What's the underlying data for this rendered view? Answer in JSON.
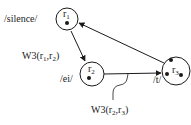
{
  "diagram": {
    "nodes": [
      {
        "id": "r1",
        "name": "r",
        "subscript": "1",
        "phoneme": "/silence/",
        "dots": 1
      },
      {
        "id": "r2",
        "name": "r",
        "subscript": "2",
        "phoneme": "/ei/",
        "dots": 1
      },
      {
        "id": "r3",
        "name": "r",
        "subscript": "3",
        "phoneme": "/t/",
        "dots": 3
      }
    ],
    "edges": [
      {
        "from": "r1",
        "to": "r2",
        "label_prefix": "W3(r",
        "label_sub1": "1",
        "label_mid": ",r",
        "label_sub2": "2",
        "label_suffix": ")"
      },
      {
        "from": "r2",
        "to": "r3",
        "label_prefix": "W3(r",
        "label_sub1": "2",
        "label_mid": ",r",
        "label_sub2": "3",
        "label_suffix": ")"
      },
      {
        "from": "r3",
        "to": "r1",
        "label_prefix": "",
        "label_sub1": "",
        "label_mid": "",
        "label_sub2": "",
        "label_suffix": ""
      }
    ],
    "colors": {
      "stroke": "#1a1a1a",
      "background": "#ffffff"
    }
  }
}
